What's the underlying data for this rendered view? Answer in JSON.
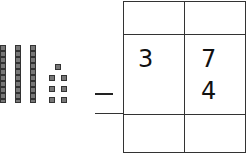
{
  "problem": {
    "operation": "-",
    "minuend": {
      "tens": "3",
      "ones": "7"
    },
    "subtrahend": {
      "tens": "",
      "ones": "4"
    },
    "answer": {
      "tens": "",
      "ones": ""
    }
  },
  "base_ten_blocks": {
    "tens_rods": 3,
    "ones_cubes": 7
  }
}
